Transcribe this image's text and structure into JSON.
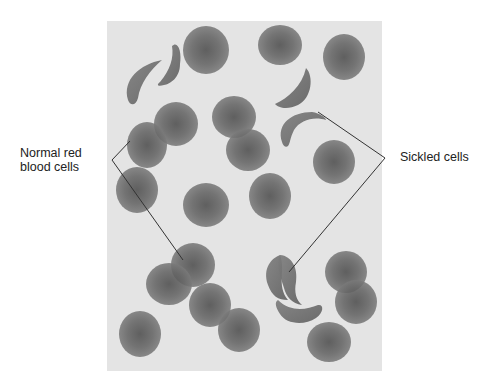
{
  "figure": {
    "panel": {
      "x": 107,
      "y": 21,
      "width": 275,
      "height": 350,
      "background": "#e4e4e4"
    },
    "colors": {
      "cell": "#6e6e6e",
      "cell_center": "#4a4a4a",
      "line": "#333333"
    }
  },
  "labels": {
    "normal": {
      "line1": "Normal red",
      "line2": "blood cells"
    },
    "sickled": "Sickled cells"
  },
  "callouts": {
    "normal": {
      "vertex": [
        112,
        160
      ],
      "targets": [
        [
          130,
          141
        ],
        [
          183,
          260
        ]
      ]
    },
    "sickled": {
      "vertex": [
        385,
        158
      ],
      "targets": [
        [
          318,
          112
        ],
        [
          289,
          272
        ]
      ]
    }
  },
  "normal_cells": [
    {
      "cx": 206,
      "cy": 50,
      "rx": 23,
      "ry": 24
    },
    {
      "cx": 280,
      "cy": 45,
      "rx": 22,
      "ry": 20
    },
    {
      "cx": 344,
      "cy": 57,
      "rx": 21,
      "ry": 23
    },
    {
      "cx": 176,
      "cy": 124,
      "rx": 22,
      "ry": 22
    },
    {
      "cx": 234,
      "cy": 117,
      "rx": 22,
      "ry": 21
    },
    {
      "cx": 248,
      "cy": 150,
      "rx": 22,
      "ry": 21
    },
    {
      "cx": 147,
      "cy": 145,
      "rx": 20,
      "ry": 23
    },
    {
      "cx": 334,
      "cy": 162,
      "rx": 21,
      "ry": 22
    },
    {
      "cx": 137,
      "cy": 190,
      "rx": 21,
      "ry": 23
    },
    {
      "cx": 206,
      "cy": 205,
      "rx": 23,
      "ry": 22
    },
    {
      "cx": 270,
      "cy": 196,
      "rx": 21,
      "ry": 23
    },
    {
      "cx": 193,
      "cy": 265,
      "rx": 22,
      "ry": 22
    },
    {
      "cx": 169,
      "cy": 284,
      "rx": 23,
      "ry": 21
    },
    {
      "cx": 210,
      "cy": 305,
      "rx": 21,
      "ry": 22
    },
    {
      "cx": 239,
      "cy": 330,
      "rx": 21,
      "ry": 22
    },
    {
      "cx": 140,
      "cy": 334,
      "rx": 21,
      "ry": 23
    },
    {
      "cx": 346,
      "cy": 272,
      "rx": 21,
      "ry": 21
    },
    {
      "cx": 356,
      "cy": 302,
      "rx": 21,
      "ry": 22
    },
    {
      "cx": 329,
      "cy": 342,
      "rx": 22,
      "ry": 20
    }
  ],
  "sickle_cells": [
    {
      "d": "M128,100 C122,80 140,64 162,60 C150,70 140,84 138,98 C136,106 130,106 128,100 Z"
    },
    {
      "d": "M160,82 C170,70 174,58 172,46 C178,40 182,52 180,64 C180,78 170,84 164,85 C158,87 156,85 160,82 Z"
    },
    {
      "d": "M275,104 C288,98 302,86 306,68 C314,76 312,98 298,105 C288,110 278,108 275,104 Z"
    },
    {
      "d": "M282,142 C276,124 292,112 312,112 C320,113 326,118 326,120 C314,116 300,120 294,130 C290,138 290,144 288,146 C286,148 283,146 282,142 Z"
    },
    {
      "d": "M268,285 C262,268 272,258 280,255 C286,270 276,285 288,300 C278,300 272,296 268,285 Z"
    },
    {
      "d": "M280,255 C292,256 298,268 296,282 C294,292 296,300 302,305 C292,304 286,296 284,288 C280,276 276,264 280,255 Z"
    },
    {
      "d": "M278,300 C290,312 306,310 318,305 C324,304 324,312 316,318 C304,326 286,324 280,314 C276,308 274,302 278,300 Z"
    }
  ]
}
